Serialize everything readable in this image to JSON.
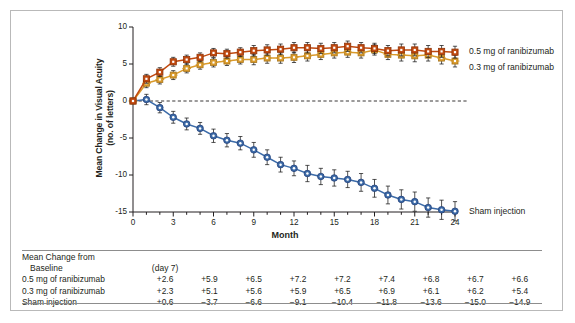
{
  "chart_data": {
    "type": "line",
    "title": "",
    "xlabel": "Month",
    "ylabel": "Mean Change in Visual Acuity (no. of letters)",
    "ylabel_line1": "Mean Change in Visual Acuity",
    "ylabel_line2": "(no. of letters)",
    "xlim": [
      0,
      24
    ],
    "ylim": [
      -15,
      10
    ],
    "xticks": [
      0,
      3,
      6,
      9,
      12,
      15,
      18,
      21,
      24
    ],
    "xtick_labels": [
      "0",
      "3",
      "6",
      "9",
      "12",
      "15",
      "18",
      "21",
      "24"
    ],
    "x_minor_interval": 1,
    "yticks": [
      10,
      5,
      0,
      -5,
      -10,
      -15
    ],
    "ytick_labels": [
      "10",
      "5",
      "0",
      "-5",
      "-10",
      "-15"
    ],
    "grid": false,
    "zero_reference_line": true,
    "legend_position": "right-inline",
    "x": [
      0,
      1,
      2,
      3,
      4,
      5,
      6,
      7,
      8,
      9,
      10,
      11,
      12,
      13,
      14,
      15,
      16,
      17,
      18,
      19,
      20,
      21,
      22,
      23,
      24
    ],
    "series": [
      {
        "name": "0.5 mg of ranibizumab",
        "color": "#C1490F",
        "marker": "square",
        "values": [
          0.0,
          3.0,
          3.9,
          5.3,
          5.6,
          5.9,
          6.5,
          6.4,
          6.6,
          6.8,
          6.9,
          7.0,
          7.2,
          7.2,
          7.1,
          7.2,
          7.4,
          7.2,
          7.1,
          6.8,
          6.9,
          6.9,
          6.7,
          6.7,
          6.6
        ],
        "errors": [
          0.0,
          0.6,
          0.6,
          0.6,
          0.6,
          0.6,
          0.6,
          0.6,
          0.6,
          0.7,
          0.7,
          0.7,
          0.7,
          0.7,
          0.7,
          0.7,
          0.7,
          0.7,
          0.7,
          0.7,
          0.8,
          0.8,
          0.8,
          0.8,
          0.8
        ]
      },
      {
        "name": "0.3 mg of ranibizumab",
        "color": "#D99A2B",
        "marker": "cross-square",
        "values": [
          0.0,
          2.4,
          2.9,
          3.5,
          4.4,
          4.9,
          5.2,
          5.4,
          5.6,
          5.6,
          5.8,
          5.8,
          5.9,
          6.1,
          6.3,
          6.5,
          6.6,
          6.5,
          6.9,
          6.3,
          6.2,
          6.1,
          6.2,
          5.8,
          5.4
        ],
        "errors": [
          0.0,
          0.6,
          0.6,
          0.6,
          0.6,
          0.6,
          0.6,
          0.6,
          0.6,
          0.7,
          0.7,
          0.7,
          0.7,
          0.7,
          0.7,
          0.7,
          0.7,
          0.7,
          0.7,
          0.7,
          0.8,
          0.8,
          0.8,
          0.8,
          0.8
        ]
      },
      {
        "name": "Sham injection",
        "color": "#3C6BA8",
        "marker": "circle",
        "values": [
          0.0,
          0.2,
          -0.9,
          -2.2,
          -3.1,
          -3.7,
          -4.7,
          -5.3,
          -5.7,
          -6.6,
          -7.6,
          -8.6,
          -9.1,
          -9.8,
          -10.2,
          -10.4,
          -10.6,
          -11.0,
          -11.8,
          -12.7,
          -13.3,
          -13.6,
          -14.4,
          -14.7,
          -14.9
        ],
        "errors": [
          0.0,
          0.7,
          0.7,
          0.8,
          0.8,
          0.8,
          0.9,
          0.9,
          0.9,
          1.0,
          1.0,
          1.0,
          1.0,
          1.1,
          1.1,
          1.1,
          1.1,
          1.2,
          1.2,
          1.2,
          1.3,
          1.3,
          1.3,
          1.3,
          1.3
        ]
      }
    ],
    "legend": [
      {
        "label": "0.5 mg of ranibizumab",
        "color": "#C1490F"
      },
      {
        "label": "0.3 mg of ranibizumab",
        "color": "#D99A2B"
      },
      {
        "label": "Sham injection",
        "color": "#3C6BA8"
      }
    ]
  },
  "table": {
    "header_title_line1": "Mean Change from",
    "header_title_line2": "Baseline",
    "header_first_col": "(day 7)",
    "columns": [
      "(day 7)",
      "",
      "",
      "",
      "",
      "",
      "",
      "",
      ""
    ],
    "rows": [
      {
        "label": "0.5 mg of ranibizumab",
        "values": [
          "+2.6",
          "+5.9",
          "+6.5",
          "+7.2",
          "+7.2",
          "+7.4",
          "+6.8",
          "+6.7",
          "+6.6"
        ]
      },
      {
        "label": "0.3 mg of ranibizumab",
        "values": [
          "+2.3",
          "+5.1",
          "+5.6",
          "+5.9",
          "+6.5",
          "+6.9",
          "+6.1",
          "+6.2",
          "+5.4"
        ]
      },
      {
        "label": "Sham injection",
        "values": [
          "+0.6",
          "−3.7",
          "−6.6",
          "−9.1",
          "−10.4",
          "−11.8",
          "−13.6",
          "−15.0",
          "−14.9"
        ]
      }
    ]
  }
}
